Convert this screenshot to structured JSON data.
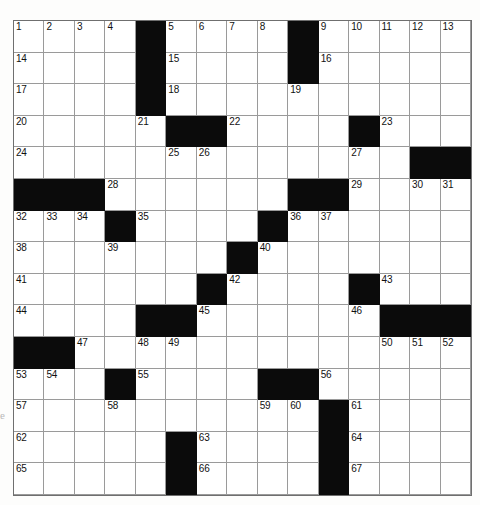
{
  "puzzle": {
    "type": "crossword-grid",
    "rows": 15,
    "columns": 15,
    "colors": {
      "block": "#0b0b0b",
      "cell": "#ffffff",
      "gridline": "#8a8a8a",
      "number": "#111111",
      "page": "#fdfdfc"
    },
    "edge_mark": "e",
    "grid": [
      [
        {
          "black": false,
          "num": "1"
        },
        {
          "black": false,
          "num": "2"
        },
        {
          "black": false,
          "num": "3"
        },
        {
          "black": false,
          "num": "4"
        },
        {
          "black": true,
          "num": ""
        },
        {
          "black": false,
          "num": "5"
        },
        {
          "black": false,
          "num": "6"
        },
        {
          "black": false,
          "num": "7"
        },
        {
          "black": false,
          "num": "8"
        },
        {
          "black": true,
          "num": ""
        },
        {
          "black": false,
          "num": "9"
        },
        {
          "black": false,
          "num": "10"
        },
        {
          "black": false,
          "num": "11"
        },
        {
          "black": false,
          "num": "12"
        },
        {
          "black": false,
          "num": "13"
        }
      ],
      [
        {
          "black": false,
          "num": "14"
        },
        {
          "black": false,
          "num": ""
        },
        {
          "black": false,
          "num": ""
        },
        {
          "black": false,
          "num": ""
        },
        {
          "black": true,
          "num": ""
        },
        {
          "black": false,
          "num": "15"
        },
        {
          "black": false,
          "num": ""
        },
        {
          "black": false,
          "num": ""
        },
        {
          "black": false,
          "num": ""
        },
        {
          "black": true,
          "num": ""
        },
        {
          "black": false,
          "num": "16"
        },
        {
          "black": false,
          "num": ""
        },
        {
          "black": false,
          "num": ""
        },
        {
          "black": false,
          "num": ""
        },
        {
          "black": false,
          "num": ""
        }
      ],
      [
        {
          "black": false,
          "num": "17"
        },
        {
          "black": false,
          "num": ""
        },
        {
          "black": false,
          "num": ""
        },
        {
          "black": false,
          "num": ""
        },
        {
          "black": true,
          "num": ""
        },
        {
          "black": false,
          "num": "18"
        },
        {
          "black": false,
          "num": ""
        },
        {
          "black": false,
          "num": ""
        },
        {
          "black": false,
          "num": ""
        },
        {
          "black": false,
          "num": "19"
        },
        {
          "black": false,
          "num": ""
        },
        {
          "black": false,
          "num": ""
        },
        {
          "black": false,
          "num": ""
        },
        {
          "black": false,
          "num": ""
        },
        {
          "black": false,
          "num": ""
        }
      ],
      [
        {
          "black": false,
          "num": "20"
        },
        {
          "black": false,
          "num": ""
        },
        {
          "black": false,
          "num": ""
        },
        {
          "black": false,
          "num": ""
        },
        {
          "black": false,
          "num": "21"
        },
        {
          "black": true,
          "num": ""
        },
        {
          "black": true,
          "num": ""
        },
        {
          "black": false,
          "num": "22"
        },
        {
          "black": false,
          "num": ""
        },
        {
          "black": false,
          "num": ""
        },
        {
          "black": false,
          "num": ""
        },
        {
          "black": true,
          "num": ""
        },
        {
          "black": false,
          "num": "23"
        },
        {
          "black": false,
          "num": ""
        },
        {
          "black": false,
          "num": ""
        }
      ],
      [
        {
          "black": false,
          "num": "24"
        },
        {
          "black": false,
          "num": ""
        },
        {
          "black": false,
          "num": ""
        },
        {
          "black": false,
          "num": ""
        },
        {
          "black": false,
          "num": ""
        },
        {
          "black": false,
          "num": "25"
        },
        {
          "black": false,
          "num": "26"
        },
        {
          "black": false,
          "num": ""
        },
        {
          "black": false,
          "num": ""
        },
        {
          "black": false,
          "num": ""
        },
        {
          "black": false,
          "num": ""
        },
        {
          "black": false,
          "num": "27"
        },
        {
          "black": false,
          "num": ""
        },
        {
          "black": true,
          "num": ""
        },
        {
          "black": true,
          "num": ""
        }
      ],
      [
        {
          "black": true,
          "num": ""
        },
        {
          "black": true,
          "num": ""
        },
        {
          "black": true,
          "num": ""
        },
        {
          "black": false,
          "num": "28"
        },
        {
          "black": false,
          "num": ""
        },
        {
          "black": false,
          "num": ""
        },
        {
          "black": false,
          "num": ""
        },
        {
          "black": false,
          "num": ""
        },
        {
          "black": false,
          "num": ""
        },
        {
          "black": true,
          "num": ""
        },
        {
          "black": true,
          "num": ""
        },
        {
          "black": false,
          "num": "29"
        },
        {
          "black": false,
          "num": ""
        },
        {
          "black": false,
          "num": "30"
        },
        {
          "black": false,
          "num": "31"
        }
      ],
      [
        {
          "black": false,
          "num": "32"
        },
        {
          "black": false,
          "num": "33"
        },
        {
          "black": false,
          "num": "34"
        },
        {
          "black": true,
          "num": ""
        },
        {
          "black": false,
          "num": "35"
        },
        {
          "black": false,
          "num": ""
        },
        {
          "black": false,
          "num": ""
        },
        {
          "black": false,
          "num": ""
        },
        {
          "black": true,
          "num": ""
        },
        {
          "black": false,
          "num": "36"
        },
        {
          "black": false,
          "num": "37"
        },
        {
          "black": false,
          "num": ""
        },
        {
          "black": false,
          "num": ""
        },
        {
          "black": false,
          "num": ""
        },
        {
          "black": false,
          "num": ""
        }
      ],
      [
        {
          "black": false,
          "num": "38"
        },
        {
          "black": false,
          "num": ""
        },
        {
          "black": false,
          "num": ""
        },
        {
          "black": false,
          "num": "39"
        },
        {
          "black": false,
          "num": ""
        },
        {
          "black": false,
          "num": ""
        },
        {
          "black": false,
          "num": ""
        },
        {
          "black": true,
          "num": ""
        },
        {
          "black": false,
          "num": "40"
        },
        {
          "black": false,
          "num": ""
        },
        {
          "black": false,
          "num": ""
        },
        {
          "black": false,
          "num": ""
        },
        {
          "black": false,
          "num": ""
        },
        {
          "black": false,
          "num": ""
        },
        {
          "black": false,
          "num": ""
        }
      ],
      [
        {
          "black": false,
          "num": "41"
        },
        {
          "black": false,
          "num": ""
        },
        {
          "black": false,
          "num": ""
        },
        {
          "black": false,
          "num": ""
        },
        {
          "black": false,
          "num": ""
        },
        {
          "black": false,
          "num": ""
        },
        {
          "black": true,
          "num": ""
        },
        {
          "black": false,
          "num": "42"
        },
        {
          "black": false,
          "num": ""
        },
        {
          "black": false,
          "num": ""
        },
        {
          "black": false,
          "num": ""
        },
        {
          "black": true,
          "num": ""
        },
        {
          "black": false,
          "num": "43"
        },
        {
          "black": false,
          "num": ""
        },
        {
          "black": false,
          "num": ""
        }
      ],
      [
        {
          "black": false,
          "num": "44"
        },
        {
          "black": false,
          "num": ""
        },
        {
          "black": false,
          "num": ""
        },
        {
          "black": false,
          "num": ""
        },
        {
          "black": true,
          "num": ""
        },
        {
          "black": true,
          "num": ""
        },
        {
          "black": false,
          "num": "45"
        },
        {
          "black": false,
          "num": ""
        },
        {
          "black": false,
          "num": ""
        },
        {
          "black": false,
          "num": ""
        },
        {
          "black": false,
          "num": ""
        },
        {
          "black": false,
          "num": "46"
        },
        {
          "black": true,
          "num": ""
        },
        {
          "black": true,
          "num": ""
        },
        {
          "black": true,
          "num": ""
        }
      ],
      [
        {
          "black": true,
          "num": ""
        },
        {
          "black": true,
          "num": ""
        },
        {
          "black": false,
          "num": "47"
        },
        {
          "black": false,
          "num": ""
        },
        {
          "black": false,
          "num": "48"
        },
        {
          "black": false,
          "num": "49"
        },
        {
          "black": false,
          "num": ""
        },
        {
          "black": false,
          "num": ""
        },
        {
          "black": false,
          "num": ""
        },
        {
          "black": false,
          "num": ""
        },
        {
          "black": false,
          "num": ""
        },
        {
          "black": false,
          "num": ""
        },
        {
          "black": false,
          "num": "50"
        },
        {
          "black": false,
          "num": "51"
        },
        {
          "black": false,
          "num": "52"
        }
      ],
      [
        {
          "black": false,
          "num": "53"
        },
        {
          "black": false,
          "num": "54"
        },
        {
          "black": false,
          "num": ""
        },
        {
          "black": true,
          "num": ""
        },
        {
          "black": false,
          "num": "55"
        },
        {
          "black": false,
          "num": ""
        },
        {
          "black": false,
          "num": ""
        },
        {
          "black": false,
          "num": ""
        },
        {
          "black": true,
          "num": ""
        },
        {
          "black": true,
          "num": ""
        },
        {
          "black": false,
          "num": "56"
        },
        {
          "black": false,
          "num": ""
        },
        {
          "black": false,
          "num": ""
        },
        {
          "black": false,
          "num": ""
        },
        {
          "black": false,
          "num": ""
        }
      ],
      [
        {
          "black": false,
          "num": "57"
        },
        {
          "black": false,
          "num": ""
        },
        {
          "black": false,
          "num": ""
        },
        {
          "black": false,
          "num": "58"
        },
        {
          "black": false,
          "num": ""
        },
        {
          "black": false,
          "num": ""
        },
        {
          "black": false,
          "num": ""
        },
        {
          "black": false,
          "num": ""
        },
        {
          "black": false,
          "num": "59"
        },
        {
          "black": false,
          "num": "60"
        },
        {
          "black": true,
          "num": ""
        },
        {
          "black": false,
          "num": "61"
        },
        {
          "black": false,
          "num": ""
        },
        {
          "black": false,
          "num": ""
        },
        {
          "black": false,
          "num": ""
        }
      ],
      [
        {
          "black": false,
          "num": "62"
        },
        {
          "black": false,
          "num": ""
        },
        {
          "black": false,
          "num": ""
        },
        {
          "black": false,
          "num": ""
        },
        {
          "black": false,
          "num": ""
        },
        {
          "black": true,
          "num": ""
        },
        {
          "black": false,
          "num": "63"
        },
        {
          "black": false,
          "num": ""
        },
        {
          "black": false,
          "num": ""
        },
        {
          "black": false,
          "num": ""
        },
        {
          "black": true,
          "num": ""
        },
        {
          "black": false,
          "num": "64"
        },
        {
          "black": false,
          "num": ""
        },
        {
          "black": false,
          "num": ""
        },
        {
          "black": false,
          "num": ""
        }
      ],
      [
        {
          "black": false,
          "num": "65"
        },
        {
          "black": false,
          "num": ""
        },
        {
          "black": false,
          "num": ""
        },
        {
          "black": false,
          "num": ""
        },
        {
          "black": false,
          "num": ""
        },
        {
          "black": true,
          "num": ""
        },
        {
          "black": false,
          "num": "66"
        },
        {
          "black": false,
          "num": ""
        },
        {
          "black": false,
          "num": ""
        },
        {
          "black": false,
          "num": ""
        },
        {
          "black": true,
          "num": ""
        },
        {
          "black": false,
          "num": "67"
        },
        {
          "black": false,
          "num": ""
        },
        {
          "black": false,
          "num": ""
        },
        {
          "black": false,
          "num": ""
        }
      ]
    ]
  }
}
